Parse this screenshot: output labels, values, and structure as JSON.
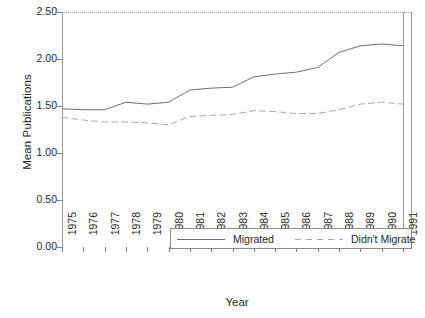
{
  "chart_data": {
    "type": "line",
    "title": "",
    "subtitle": "",
    "xlabel": "Year",
    "ylabel": "Mean Publications",
    "x": [
      1975,
      1976,
      1977,
      1978,
      1979,
      1980,
      1981,
      1982,
      1983,
      1984,
      1985,
      1986,
      1987,
      1988,
      1989,
      1990,
      1991
    ],
    "categories": [
      "1975",
      "1976",
      "1977",
      "1978",
      "1979",
      "1980",
      "1981",
      "1982",
      "1983",
      "1984",
      "1985",
      "1986",
      "1987",
      "1988",
      "1989",
      "1990",
      "1991"
    ],
    "xlim": [
      1975,
      1991
    ],
    "ylim": [
      0.0,
      2.5
    ],
    "yticks": [
      0.0,
      0.5,
      1.0,
      1.5,
      2.0,
      2.5
    ],
    "ytick_labels": [
      "0.00",
      "0.50",
      "1.00",
      "1.50",
      "2.00",
      "2.50"
    ],
    "xtick_labels": [
      "1975",
      "1976",
      "1977",
      "1978",
      "1979",
      "1980",
      "1981",
      "1982",
      "1983",
      "1984",
      "1985",
      "1986",
      "1987",
      "1988",
      "1989",
      "1990",
      "1991"
    ],
    "grid": false,
    "legend_position": "lower center",
    "series": [
      {
        "name": "Migrated",
        "style": "solid",
        "color": "#6f6f6f",
        "values": [
          1.47,
          1.46,
          1.46,
          1.54,
          1.52,
          1.54,
          1.67,
          1.69,
          1.7,
          1.81,
          1.84,
          1.86,
          1.91,
          2.07,
          2.14,
          2.16,
          2.14
        ]
      },
      {
        "name": "Didn't Migrate",
        "style": "dashed",
        "color": "#a8a8a8",
        "values": [
          1.38,
          1.35,
          1.33,
          1.33,
          1.32,
          1.3,
          1.39,
          1.4,
          1.41,
          1.45,
          1.44,
          1.42,
          1.42,
          1.46,
          1.52,
          1.54,
          1.52
        ]
      }
    ]
  },
  "axes": {
    "ylabel_text": "Mean Publications",
    "xlabel_text": "Year"
  },
  "legend": {
    "entries": [
      {
        "label": "Migrated",
        "style": "solid"
      },
      {
        "label": "Didn't Migrate",
        "style": "dashed"
      }
    ]
  },
  "colors": {
    "series_migrated": "#6f6f6f",
    "series_didnt_migrate": "#a8a8a8",
    "axis": "#9a9a9a",
    "text": "#262626",
    "background": "#ffffff"
  }
}
